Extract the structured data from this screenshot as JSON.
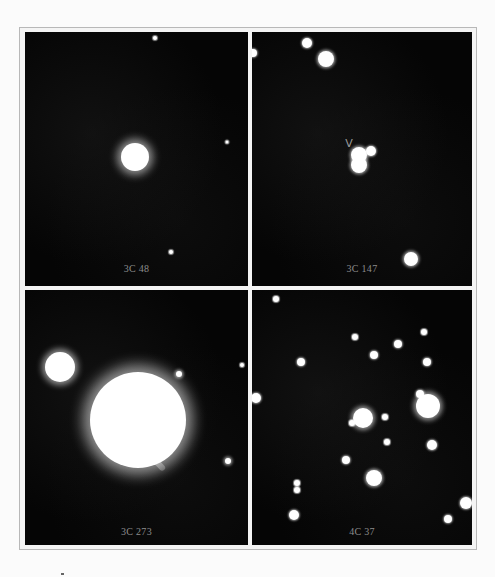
{
  "figure": {
    "panels": [
      {
        "id": "3c48",
        "label": "3C 48",
        "box": {
          "left": 25,
          "top": 32,
          "width": 223,
          "height": 254
        },
        "label_top": 231,
        "stars": [
          {
            "x": 110,
            "y": 125,
            "r": 14,
            "glow": 8
          },
          {
            "x": 130,
            "y": 6,
            "r": 2,
            "glow": 1
          },
          {
            "x": 202,
            "y": 110,
            "r": 1.5,
            "glow": 1
          },
          {
            "x": 146,
            "y": 220,
            "r": 2,
            "glow": 1
          }
        ]
      },
      {
        "id": "3c147",
        "label": "3C 147",
        "box": {
          "left": 252,
          "top": 32,
          "width": 220,
          "height": 254
        },
        "label_top": 231,
        "marker": {
          "glyph": "V",
          "x": 97,
          "y": 111
        },
        "stars": [
          {
            "x": 55,
            "y": 11,
            "r": 5,
            "glow": 2
          },
          {
            "x": 74,
            "y": 27,
            "r": 8,
            "glow": 3
          },
          {
            "x": 1,
            "y": 21,
            "r": 4,
            "glow": 2
          },
          {
            "x": 107,
            "y": 123,
            "r": 8,
            "glow": 3
          },
          {
            "x": 107,
            "y": 133,
            "r": 8,
            "glow": 3
          },
          {
            "x": 119,
            "y": 119,
            "r": 5,
            "glow": 2
          },
          {
            "x": 159,
            "y": 227,
            "r": 7,
            "glow": 3
          }
        ]
      },
      {
        "id": "3c273",
        "label": "3C 273",
        "box": {
          "left": 25,
          "top": 290,
          "width": 223,
          "height": 255
        },
        "label_top": 236,
        "jet": {
          "x": 116,
          "y": 152,
          "length": 34,
          "angle": 47
        },
        "stars": [
          {
            "x": 35,
            "y": 77,
            "r": 15,
            "glow": 6
          },
          {
            "x": 113,
            "y": 130,
            "r": 48,
            "glow": 14
          },
          {
            "x": 154,
            "y": 84,
            "r": 3,
            "glow": 3
          },
          {
            "x": 203,
            "y": 171,
            "r": 3,
            "glow": 3
          },
          {
            "x": 217,
            "y": 75,
            "r": 2,
            "glow": 1
          }
        ]
      },
      {
        "id": "4c37",
        "label": "4C 37",
        "box": {
          "left": 252,
          "top": 290,
          "width": 220,
          "height": 255
        },
        "label_top": 236,
        "stars": [
          {
            "x": 24,
            "y": 9,
            "r": 3,
            "glow": 1
          },
          {
            "x": 4,
            "y": 108,
            "r": 5,
            "glow": 2
          },
          {
            "x": 49,
            "y": 72,
            "r": 4,
            "glow": 2
          },
          {
            "x": 103,
            "y": 47,
            "r": 3,
            "glow": 1
          },
          {
            "x": 122,
            "y": 65,
            "r": 4,
            "glow": 2
          },
          {
            "x": 146,
            "y": 54,
            "r": 4,
            "glow": 2
          },
          {
            "x": 172,
            "y": 42,
            "r": 3,
            "glow": 1
          },
          {
            "x": 175,
            "y": 72,
            "r": 4,
            "glow": 2
          },
          {
            "x": 168,
            "y": 104,
            "r": 4,
            "glow": 2
          },
          {
            "x": 176,
            "y": 116,
            "r": 12,
            "glow": 5
          },
          {
            "x": 111,
            "y": 128,
            "r": 10,
            "glow": 4
          },
          {
            "x": 100,
            "y": 133,
            "r": 3,
            "glow": 1
          },
          {
            "x": 133,
            "y": 127,
            "r": 3,
            "glow": 1
          },
          {
            "x": 135,
            "y": 152,
            "r": 3,
            "glow": 1
          },
          {
            "x": 180,
            "y": 155,
            "r": 5,
            "glow": 2
          },
          {
            "x": 94,
            "y": 170,
            "r": 4,
            "glow": 2
          },
          {
            "x": 122,
            "y": 188,
            "r": 8,
            "glow": 3
          },
          {
            "x": 45,
            "y": 193,
            "r": 3,
            "glow": 1
          },
          {
            "x": 45,
            "y": 200,
            "r": 3,
            "glow": 1
          },
          {
            "x": 214,
            "y": 213,
            "r": 6,
            "glow": 2
          },
          {
            "x": 42,
            "y": 225,
            "r": 5,
            "glow": 2
          },
          {
            "x": 196,
            "y": 229,
            "r": 4,
            "glow": 2
          }
        ]
      }
    ]
  }
}
